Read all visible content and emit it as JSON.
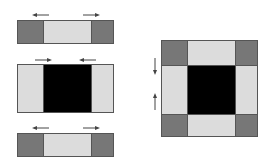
{
  "colors": {
    "dark": "#777777",
    "light": "#dcdcdc",
    "black": "#000000",
    "border": "#555555",
    "arrow": "#444444"
  },
  "diagram": {
    "left_strips": [
      {
        "name": "top-strip",
        "cells": [
          "dark",
          "light",
          "dark"
        ],
        "arrows": [
          "left",
          "right"
        ]
      },
      {
        "name": "middle-strip",
        "cells": [
          "light",
          "black",
          "light"
        ],
        "arrows": [
          "right",
          "left"
        ]
      },
      {
        "name": "bottom-strip",
        "cells": [
          "dark",
          "light",
          "dark"
        ],
        "arrows": [
          "left",
          "right"
        ]
      }
    ],
    "square": {
      "grid": [
        [
          "dark",
          "light",
          "dark"
        ],
        [
          "light",
          "black",
          "light"
        ],
        [
          "dark",
          "light",
          "dark"
        ]
      ],
      "arrows": [
        "down",
        "up"
      ]
    }
  }
}
